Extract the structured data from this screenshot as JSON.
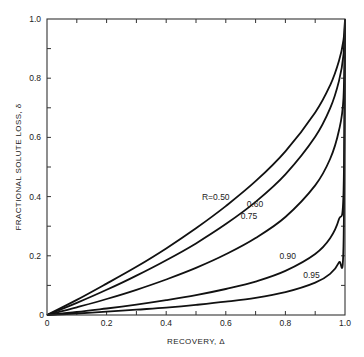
{
  "chart_data": {
    "type": "line",
    "title": "",
    "xlabel": "RECOVERY, Δ",
    "ylabel": "FRACTIONAL SOLUTE LOSS, δ",
    "xlim": [
      0,
      1.0
    ],
    "ylim": [
      0,
      1.0
    ],
    "x_ticks": [
      "0",
      "0.2",
      "0.4",
      "0.6",
      "0.8",
      "1.0"
    ],
    "y_ticks": [
      "0",
      "0.2",
      "0.4",
      "0.6",
      "0.8",
      "1.0"
    ],
    "minor_tick_step": 0.1,
    "grid": false,
    "legend": "inline labels on curves",
    "x": [
      0,
      0.1,
      0.2,
      0.3,
      0.4,
      0.5,
      0.6,
      0.7,
      0.8,
      0.9,
      0.95,
      0.98,
      0.995,
      1.0
    ],
    "series": [
      {
        "name": "R=0.50",
        "label": "R=0.50",
        "values": [
          0,
          0.051,
          0.106,
          0.163,
          0.225,
          0.293,
          0.368,
          0.452,
          0.553,
          0.684,
          0.776,
          0.859,
          0.929,
          1.0
        ]
      },
      {
        "name": "0.60",
        "label": "0.60",
        "values": [
          0,
          0.041,
          0.085,
          0.133,
          0.185,
          0.242,
          0.307,
          0.382,
          0.475,
          0.602,
          0.698,
          0.791,
          0.88,
          1.0
        ]
      },
      {
        "name": "0.75",
        "label": "0.75",
        "values": [
          0,
          0.026,
          0.054,
          0.085,
          0.12,
          0.159,
          0.205,
          0.26,
          0.331,
          0.438,
          0.527,
          0.624,
          0.734,
          1.0
        ]
      },
      {
        "name": "0.90",
        "label": "0.90",
        "values": [
          0,
          0.01,
          0.022,
          0.035,
          0.05,
          0.067,
          0.088,
          0.113,
          0.149,
          0.206,
          0.259,
          0.324,
          0.411,
          1.0
        ]
      },
      {
        "name": "0.95",
        "label": "0.95",
        "values": [
          0,
          0.005,
          0.011,
          0.018,
          0.025,
          0.034,
          0.045,
          0.058,
          0.077,
          0.109,
          0.139,
          0.178,
          0.233,
          1.0
        ]
      }
    ],
    "annotations": [
      {
        "text": "R=0.50",
        "x": 0.52,
        "y": 0.39
      },
      {
        "text": "0.60",
        "x": 0.67,
        "y": 0.365
      },
      {
        "text": "0.75",
        "x": 0.65,
        "y": 0.325
      },
      {
        "text": "0.90",
        "x": 0.78,
        "y": 0.19
      },
      {
        "text": "0.95",
        "x": 0.86,
        "y": 0.125
      }
    ]
  }
}
